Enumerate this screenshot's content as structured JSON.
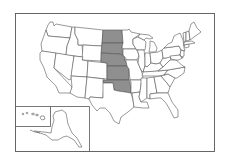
{
  "map": {
    "title": "United States map with highlighted states",
    "colors": {
      "background": "#ffffff",
      "state_fill": "#ffffff",
      "highlight_fill": "#8f8f8f",
      "border": "#555555"
    },
    "highlighted_states": [
      "North Dakota",
      "South Dakota",
      "Nebraska",
      "Kansas",
      "Oklahoma"
    ],
    "insets": [
      "Hawaii",
      "Alaska"
    ]
  }
}
